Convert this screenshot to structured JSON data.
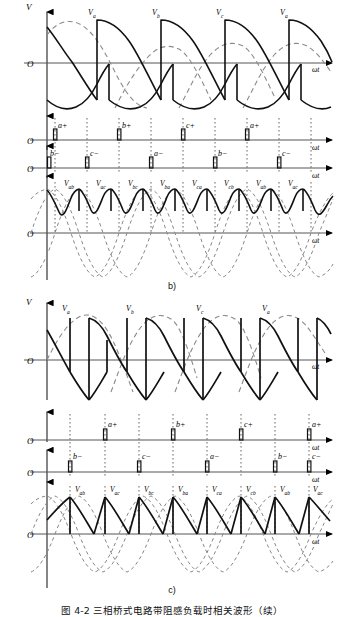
{
  "figure": {
    "caption": "图 4-2   三相桥式电路带阻感负载时相关波形（续）",
    "panel_b_label": "b)",
    "panel_c_label": "c)"
  },
  "axis": {
    "v_label": "V",
    "origin_label": "O",
    "omega_t_label": "ωt"
  },
  "panel_b": {
    "phase_labels": [
      "Va",
      "Vb",
      "Vc",
      "Va"
    ],
    "pulse_upper": [
      "a+",
      "b+",
      "c+",
      "a+"
    ],
    "pulse_lower": [
      "b−",
      "c−",
      "a−",
      "b−",
      "c−"
    ],
    "line_labels": [
      "Vab",
      "Vac",
      "Vbc",
      "Vba",
      "Vca",
      "Vcb",
      "Vab",
      "Vac"
    ]
  },
  "panel_c": {
    "phase_labels": [
      "Va",
      "Vb",
      "Vc",
      "Va"
    ],
    "pulse_upper": [
      "a+",
      "b+",
      "c+",
      "a+"
    ],
    "pulse_lower": [
      "b−",
      "c−",
      "a−",
      "b−",
      "c−"
    ],
    "line_labels": [
      "Vab",
      "Vac",
      "Vbc",
      "Vba",
      "Vca",
      "Vcb",
      "Vab",
      "Vac"
    ]
  },
  "chart_data": {
    "type": "line",
    "title": "三相桥式电路带阻感负载时相关波形（续）",
    "xlabel": "ωt",
    "ylabel": "V",
    "panels": [
      {
        "name": "b)",
        "alpha_deg": 60,
        "subplots": [
          {
            "name": "phase-voltage",
            "ylabel": "V",
            "xlabel": "ωt",
            "annotations": [
              "Va",
              "Vb",
              "Vc",
              "Va"
            ],
            "series": [
              {
                "name": "phase-a-reference",
                "style": "dashed"
              },
              {
                "name": "phase-b-reference",
                "style": "dashed"
              },
              {
                "name": "phase-c-reference",
                "style": "dashed"
              },
              {
                "name": "output-voltage",
                "style": "solid"
              }
            ]
          },
          {
            "name": "upper-gate-pulses",
            "ylabel": "",
            "xlabel": "ωt",
            "categories": [
              "a+",
              "b+",
              "c+",
              "a+"
            ],
            "values": [
              1,
              1,
              1,
              1
            ]
          },
          {
            "name": "lower-gate-pulses",
            "ylabel": "",
            "xlabel": "ωt",
            "categories": [
              "b−",
              "c−",
              "a−",
              "b−",
              "c−"
            ],
            "values": [
              1,
              1,
              1,
              1,
              1
            ]
          },
          {
            "name": "line-voltage",
            "ylabel": "",
            "xlabel": "ωt",
            "annotations": [
              "Vab",
              "Vac",
              "Vbc",
              "Vba",
              "Vca",
              "Vcb",
              "Vab",
              "Vac"
            ],
            "series": [
              {
                "name": "line-voltage-envelope",
                "style": "dashed"
              },
              {
                "name": "rectified-output",
                "style": "solid"
              }
            ]
          }
        ]
      },
      {
        "name": "c)",
        "alpha_deg": 90,
        "subplots": [
          {
            "name": "phase-voltage",
            "ylabel": "V",
            "xlabel": "ωt",
            "annotations": [
              "Va",
              "Vb",
              "Vc",
              "Va"
            ],
            "series": [
              {
                "name": "phase-a-reference",
                "style": "dashed"
              },
              {
                "name": "phase-b-reference",
                "style": "dashed"
              },
              {
                "name": "phase-c-reference",
                "style": "dashed"
              },
              {
                "name": "output-voltage",
                "style": "solid"
              }
            ]
          },
          {
            "name": "upper-gate-pulses",
            "ylabel": "",
            "xlabel": "ωt",
            "categories": [
              "a+",
              "b+",
              "c+",
              "a+"
            ],
            "values": [
              1,
              1,
              1,
              1
            ]
          },
          {
            "name": "lower-gate-pulses",
            "ylabel": "",
            "xlabel": "ωt",
            "categories": [
              "b−",
              "c−",
              "a−",
              "b−",
              "c−"
            ],
            "values": [
              1,
              1,
              1,
              1,
              1
            ]
          },
          {
            "name": "line-voltage",
            "ylabel": "",
            "xlabel": "ωt",
            "annotations": [
              "Vab",
              "Vac",
              "Vbc",
              "Vba",
              "Vca",
              "Vcb",
              "Vab",
              "Vac"
            ],
            "series": [
              {
                "name": "line-voltage-envelope",
                "style": "dashed"
              },
              {
                "name": "rectified-output",
                "style": "solid"
              }
            ]
          }
        ]
      }
    ]
  }
}
